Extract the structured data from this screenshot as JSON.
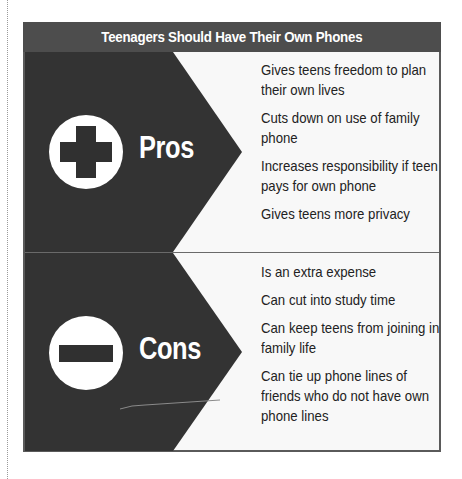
{
  "title": "Teenagers Should Have Their Own Phones",
  "colors": {
    "title_bar": "#4d4d4d",
    "arrow_fill": "#333333",
    "panel_bg": "#f8f8f8",
    "text": "#222222",
    "label_text": "#ffffff"
  },
  "pros": {
    "label": "Pros",
    "icon": "plus-icon",
    "items": [
      "Gives teens freedom to plan their own lives",
      "Cuts down on use of family phone",
      "Increases responsibility if teen pays for own phone",
      "Gives teens more privacy"
    ]
  },
  "cons": {
    "label": "Cons",
    "icon": "minus-icon",
    "items": [
      "Is an extra expense",
      "Can cut into study time",
      "Can keep teens from joining in family life",
      "Can tie up phone lines of friends who do not have own phone lines"
    ]
  }
}
